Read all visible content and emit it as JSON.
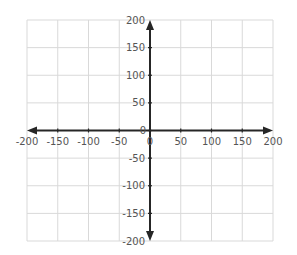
{
  "chart_data": {
    "type": "scatter",
    "title": "",
    "xlabel": "",
    "ylabel": "",
    "xlim": [
      -200,
      200
    ],
    "ylim": [
      -200,
      200
    ],
    "grid": true,
    "legend": null,
    "series": [],
    "x_ticks": [
      -200,
      -150,
      -100,
      -50,
      0,
      50,
      100,
      150,
      200
    ],
    "y_ticks": [
      -200,
      -150,
      -100,
      -50,
      0,
      50,
      100,
      150,
      200
    ],
    "x_tick_labels": [
      "-200",
      "-150",
      "-100",
      "-50",
      "0",
      "50",
      "100",
      "150",
      "200"
    ],
    "y_tick_labels": [
      "-200",
      "-150",
      "-100",
      "-50",
      "0",
      "50",
      "100",
      "150",
      "200"
    ],
    "axes_style": "centered coordinate plane with arrows on both ends",
    "colors": {
      "grid": "#d9d9d9",
      "axis": "#262626",
      "label": "#555555"
    }
  }
}
